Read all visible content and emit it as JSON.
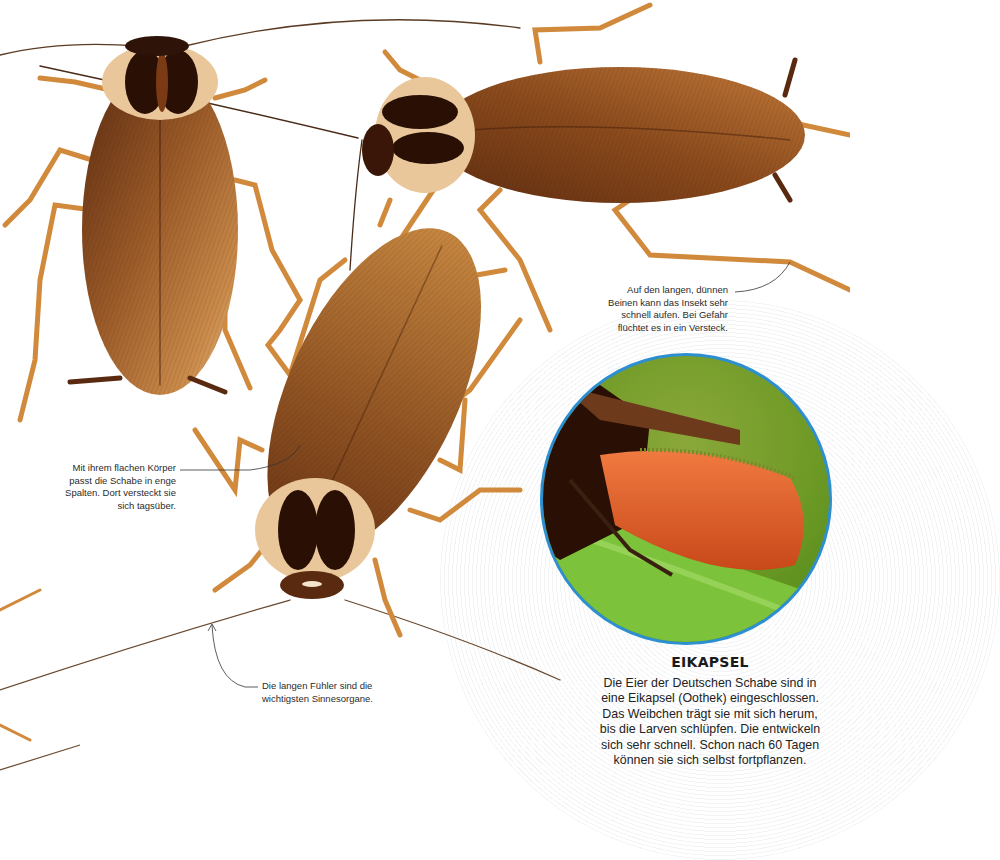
{
  "page": {
    "colors": {
      "background": "#ffffff",
      "cockroach_body": "#8a4a1c",
      "cockroach_dark": "#3a1608",
      "cockroach_leg": "#d18a3c",
      "inset_ring": "#2e8fd0",
      "inset_leaf": "#6fae2a",
      "egg_capsule": "#e0622a",
      "text": "#222222"
    }
  },
  "captions": {
    "legs": {
      "lines": [
        "Auf den langen, dünnen",
        "Beinen kann das Insekt sehr",
        "schnell  aufen. Bei Gefahr",
        "flüchtet es in ein Versteck."
      ]
    },
    "body": {
      "lines": [
        "Mit ihrem flachen Körper",
        "passt die Schabe in enge",
        "Spalten. Dort versteckt sie",
        "sich tagsüber."
      ]
    },
    "antennae": {
      "lines": [
        "Die langen Fühler sind die",
        "wichtigsten Sinnesorgane."
      ]
    }
  },
  "inset": {
    "title": "EIKAPSEL",
    "image_alt": "Weibchen mit Eikapsel (Oothek) auf einem Blatt",
    "body_lines": [
      "Die Eier der Deutschen Schabe sind in",
      "eine Eikapsel (Oothek) eingeschlossen.",
      "Das Weibchen trägt sie mit sich herum,",
      "bis die Larven schlüpfen. Die entwickeln",
      "sich sehr schnell. Schon nach 60 Tagen",
      "können sie sich selbst fortpflanzen."
    ]
  },
  "figures": [
    {
      "name": "cockroach-top-left",
      "orientation": "head up"
    },
    {
      "name": "cockroach-top-right",
      "orientation": "head left"
    },
    {
      "name": "cockroach-center",
      "orientation": "head down"
    }
  ]
}
